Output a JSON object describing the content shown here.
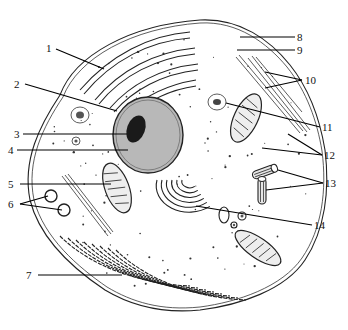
{
  "diagram": {
    "colors": {
      "ink": "#111111",
      "nucleus_fill": "#b8b8b8",
      "nucleolus_fill": "#1a1a1a",
      "background": "#ffffff"
    },
    "labels": [
      {
        "id": "1",
        "text": "1"
      },
      {
        "id": "2",
        "text": "2"
      },
      {
        "id": "3",
        "text": "3"
      },
      {
        "id": "4",
        "text": "4"
      },
      {
        "id": "5",
        "text": "5"
      },
      {
        "id": "6",
        "text": "6"
      },
      {
        "id": "7",
        "text": "7"
      },
      {
        "id": "8",
        "text": "8"
      },
      {
        "id": "9",
        "text": "9"
      },
      {
        "id": "10",
        "text": "10"
      },
      {
        "id": "11",
        "text": "11"
      },
      {
        "id": "12",
        "text": "12"
      },
      {
        "id": "13",
        "text": "13"
      },
      {
        "id": "14",
        "text": "14"
      }
    ]
  }
}
